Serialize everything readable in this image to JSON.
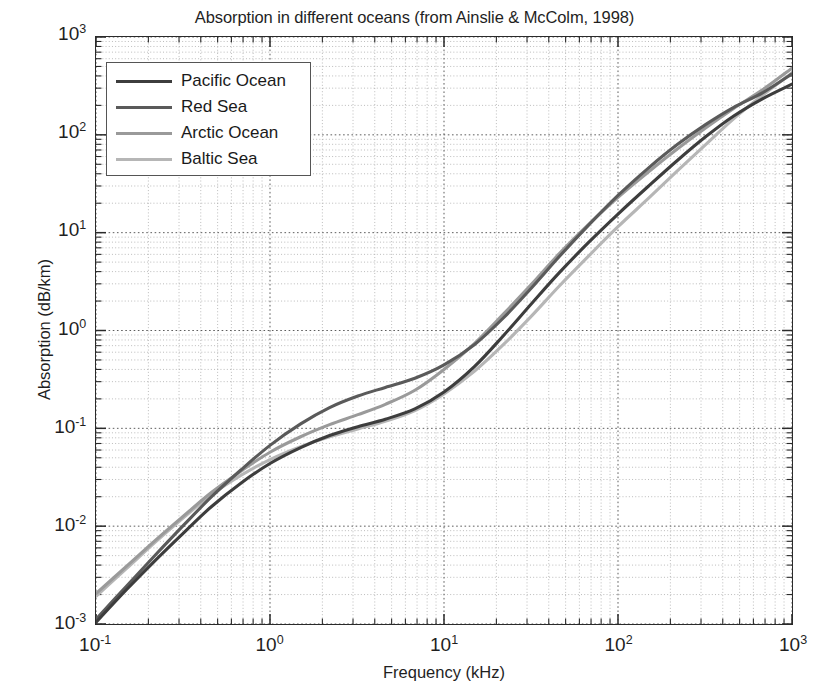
{
  "chart_data": {
    "type": "line",
    "title": "Absorption in different oceans (from Ainslie & McColm, 1998)",
    "xlabel": "Frequency (kHz)",
    "ylabel": "Absorption (dB/km)",
    "xscale": "log",
    "yscale": "log",
    "xlim": [
      0.1,
      1000
    ],
    "ylim": [
      0.001,
      1000
    ],
    "grid": true,
    "legend_position": "upper left",
    "xticks": [
      {
        "value": 0.1,
        "label": "10",
        "exponent": "-1"
      },
      {
        "value": 1,
        "label": "10",
        "exponent": "0"
      },
      {
        "value": 10,
        "label": "10",
        "exponent": "1"
      },
      {
        "value": 100,
        "label": "10",
        "exponent": "2"
      },
      {
        "value": 1000,
        "label": "10",
        "exponent": "3"
      }
    ],
    "yticks": [
      {
        "value": 1000,
        "label": "10",
        "exponent": "3"
      },
      {
        "value": 100,
        "label": "10",
        "exponent": "2"
      },
      {
        "value": 10,
        "label": "10",
        "exponent": "1"
      },
      {
        "value": 1,
        "label": "10",
        "exponent": "0"
      },
      {
        "value": 0.1,
        "label": "10",
        "exponent": "-1"
      },
      {
        "value": 0.01,
        "label": "10",
        "exponent": "-2"
      },
      {
        "value": 0.001,
        "label": "10",
        "exponent": "-3"
      }
    ],
    "x": [
      0.1,
      0.15,
      0.22,
      0.32,
      0.46,
      0.68,
      1.0,
      1.5,
      2.2,
      3.2,
      4.6,
      6.8,
      10,
      15,
      22,
      32,
      46,
      68,
      100,
      150,
      220,
      320,
      460,
      680,
      1000
    ],
    "series": [
      {
        "name": "Pacific Ocean",
        "color": "#3d3d3d",
        "linewidth": 3.1,
        "values": [
          0.00104,
          0.00225,
          0.0045,
          0.0086,
          0.0158,
          0.0275,
          0.0437,
          0.0635,
          0.0845,
          0.104,
          0.124,
          0.158,
          0.235,
          0.43,
          0.89,
          1.9,
          3.9,
          8.0,
          15.5,
          30.0,
          55.0,
          96.0,
          155.0,
          235.0,
          330.0
        ]
      },
      {
        "name": "Red Sea",
        "color": "#5a5a5a",
        "linewidth": 3.1,
        "values": [
          0.00112,
          0.00245,
          0.0051,
          0.0103,
          0.0199,
          0.0375,
          0.067,
          0.111,
          0.163,
          0.214,
          0.262,
          0.325,
          0.445,
          0.72,
          1.35,
          2.75,
          5.7,
          12.0,
          24.0,
          46.0,
          80.0,
          128.0,
          190.0,
          270.0,
          420.0
        ]
      },
      {
        "name": "Arctic Ocean",
        "color": "#9a9a9a",
        "linewidth": 3.1,
        "values": [
          0.00205,
          0.0039,
          0.0072,
          0.0128,
          0.0221,
          0.0365,
          0.057,
          0.082,
          0.109,
          0.138,
          0.176,
          0.245,
          0.4,
          0.74,
          1.48,
          3.0,
          6.1,
          12.2,
          23.0,
          42.0,
          72.0,
          118.0,
          185.0,
          290.0,
          480.0
        ]
      },
      {
        "name": "Baltic Sea",
        "color": "#b6b6b6",
        "linewidth": 3.1,
        "values": [
          0.00192,
          0.0037,
          0.0069,
          0.0123,
          0.0209,
          0.033,
          0.048,
          0.065,
          0.082,
          0.0985,
          0.118,
          0.152,
          0.225,
          0.385,
          0.72,
          1.42,
          2.85,
          5.8,
          11.5,
          22.5,
          43.0,
          80.0,
          145.0,
          255.0,
          430.0
        ]
      }
    ]
  },
  "legend": {
    "entries": [
      {
        "label": "Pacific Ocean"
      },
      {
        "label": "Red Sea"
      },
      {
        "label": "Arctic Ocean"
      },
      {
        "label": "Baltic Sea"
      }
    ]
  }
}
